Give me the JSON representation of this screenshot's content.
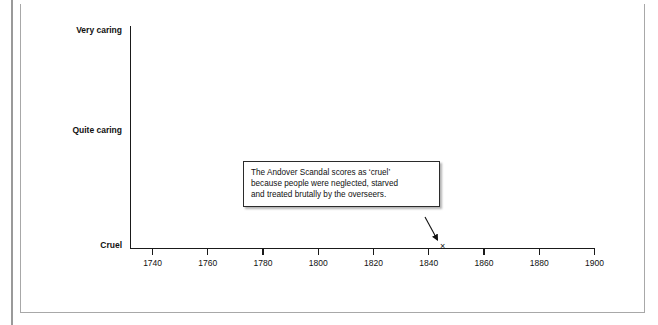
{
  "chart_data": {
    "type": "scatter",
    "title": "",
    "subtitle": "",
    "xlabel": "",
    "ylabel": "",
    "grid": false,
    "legend": "none",
    "x_axis": {
      "ticks": [
        1740,
        1760,
        1780,
        1800,
        1820,
        1840,
        1860,
        1880,
        1900
      ],
      "tick_labels": [
        "1740",
        "1760",
        "1780",
        "1800",
        "1820",
        "1840",
        "1860",
        "1880",
        "1900"
      ],
      "min": 1732,
      "max": 1900
    },
    "y_axis": {
      "type": "categorical",
      "categories": [
        "Cruel",
        "Quite caring",
        "Very caring"
      ],
      "tick_labels": [
        "Very caring",
        "Quite caring",
        "Cruel"
      ]
    },
    "series": [
      {
        "name": "Andover Scandal",
        "marker": "x",
        "points": [
          {
            "x": 1845,
            "y": "Cruel",
            "label": "×"
          }
        ]
      }
    ],
    "annotations": [
      {
        "id": "andover-callout",
        "text": "The Andover Scandal scores as ‘cruel’\nbecause people were neglected, starved\nand treated brutally by the overseers.",
        "points_to": {
          "x": 1845,
          "y": "Cruel"
        }
      }
    ]
  },
  "axis_labels": {
    "y": [
      {
        "text": "Very caring",
        "top": 25
      },
      {
        "text": "Quite caring",
        "top": 125
      },
      {
        "text": "Cruel",
        "top": 240
      }
    ]
  },
  "colors": {
    "axis": "#1a1a1a",
    "text": "#111111",
    "frame": "#a8a8a8",
    "callout_border": "#2b2b2b",
    "background": "#ffffff"
  }
}
